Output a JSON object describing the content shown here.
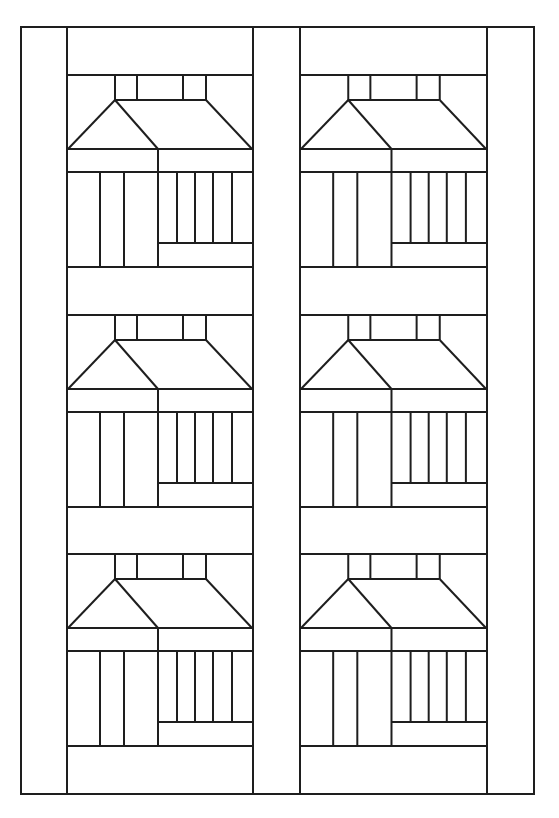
{
  "colors": {
    "line": "#1e1e1e",
    "background": "#ffffff"
  },
  "quilt": {
    "outer": {
      "x": 21,
      "y": 27,
      "w": 513,
      "h": 767
    },
    "columns": [
      {
        "x": 67,
        "w": 186
      },
      {
        "x": 300,
        "w": 187
      }
    ],
    "blocks_y": [
      75,
      315,
      554
    ],
    "block_height": 192,
    "layout": "2 columns x 3 rows of schoolhouse blocks with sashing strips and borders",
    "block_count": 6
  }
}
